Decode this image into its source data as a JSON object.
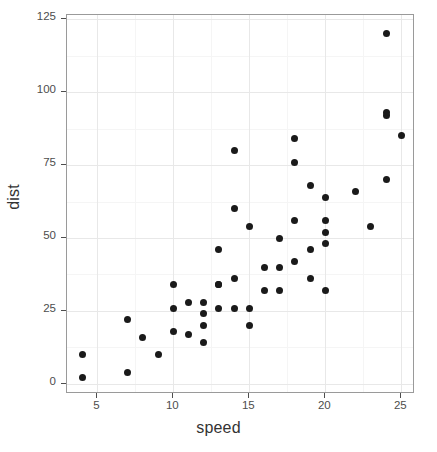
{
  "chart_data": {
    "type": "scatter",
    "title": "",
    "subtitle": "",
    "xlabel": "speed",
    "ylabel": "dist",
    "xlim": [
      3.0,
      25.9
    ],
    "ylim": [
      -3.5,
      126.5
    ],
    "xticks": [
      5,
      10,
      15,
      20,
      25
    ],
    "yticks": [
      0,
      25,
      50,
      75,
      100,
      125
    ],
    "xtick_labels": [
      "5",
      "10",
      "15",
      "20",
      "25"
    ],
    "ytick_labels": [
      "0",
      "25",
      "50",
      "75",
      "100",
      "125"
    ],
    "x_minor_ticks": [
      7.5,
      12.5,
      17.5,
      22.5
    ],
    "y_minor_ticks": [
      12.5,
      37.5,
      62.5,
      87.5,
      112.5
    ],
    "grid": true,
    "legend": null,
    "legend_position": "none",
    "n_points": 50,
    "marker": {
      "shape": "circle",
      "color": "#1a1a1a",
      "size_px": 7
    },
    "points": [
      {
        "x": 4,
        "y": 2
      },
      {
        "x": 4,
        "y": 10
      },
      {
        "x": 7,
        "y": 4
      },
      {
        "x": 7,
        "y": 22
      },
      {
        "x": 8,
        "y": 16
      },
      {
        "x": 9,
        "y": 10
      },
      {
        "x": 10,
        "y": 18
      },
      {
        "x": 10,
        "y": 26
      },
      {
        "x": 10,
        "y": 34
      },
      {
        "x": 11,
        "y": 17
      },
      {
        "x": 11,
        "y": 28
      },
      {
        "x": 12,
        "y": 14
      },
      {
        "x": 12,
        "y": 20
      },
      {
        "x": 12,
        "y": 24
      },
      {
        "x": 12,
        "y": 28
      },
      {
        "x": 13,
        "y": 26
      },
      {
        "x": 13,
        "y": 34
      },
      {
        "x": 13,
        "y": 34
      },
      {
        "x": 13,
        "y": 46
      },
      {
        "x": 14,
        "y": 26
      },
      {
        "x": 14,
        "y": 36
      },
      {
        "x": 14,
        "y": 60
      },
      {
        "x": 14,
        "y": 80
      },
      {
        "x": 15,
        "y": 20
      },
      {
        "x": 15,
        "y": 26
      },
      {
        "x": 15,
        "y": 54
      },
      {
        "x": 16,
        "y": 32
      },
      {
        "x": 16,
        "y": 40
      },
      {
        "x": 17,
        "y": 32
      },
      {
        "x": 17,
        "y": 40
      },
      {
        "x": 17,
        "y": 50
      },
      {
        "x": 18,
        "y": 42
      },
      {
        "x": 18,
        "y": 56
      },
      {
        "x": 18,
        "y": 76
      },
      {
        "x": 18,
        "y": 84
      },
      {
        "x": 19,
        "y": 36
      },
      {
        "x": 19,
        "y": 46
      },
      {
        "x": 19,
        "y": 68
      },
      {
        "x": 20,
        "y": 32
      },
      {
        "x": 20,
        "y": 48
      },
      {
        "x": 20,
        "y": 52
      },
      {
        "x": 20,
        "y": 56
      },
      {
        "x": 20,
        "y": 64
      },
      {
        "x": 22,
        "y": 66
      },
      {
        "x": 23,
        "y": 54
      },
      {
        "x": 24,
        "y": 70
      },
      {
        "x": 24,
        "y": 92
      },
      {
        "x": 24,
        "y": 93
      },
      {
        "x": 24,
        "y": 120
      },
      {
        "x": 25,
        "y": 85
      }
    ],
    "colors": {
      "point": "#1a1a1a",
      "panel_background": "#ffffff",
      "panel_border": "#9a9a9a",
      "major_grid": "#e8e8e8",
      "minor_grid": "#f5f5f5",
      "tick_label": "#4d4d4d",
      "axis_title": "#333333"
    }
  }
}
